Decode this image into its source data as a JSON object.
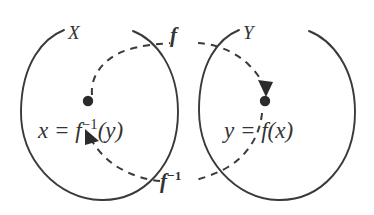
{
  "figure": {
    "type": "mathematical-diagram",
    "ink_color": "#3a3a3a",
    "background_color": "#ffffff",
    "sets": [
      {
        "id": "X",
        "label": "X",
        "side": "left",
        "element_label_plain": "x = f^-1(y)",
        "element_label_lhs": "x = f",
        "element_label_sup": "−1",
        "element_label_rhs": "(y)"
      },
      {
        "id": "Y",
        "label": "Y",
        "side": "right",
        "element_label_plain": "y = f(x)",
        "element_label_lhs": "y = f(x)",
        "element_label_sup": "",
        "element_label_rhs": ""
      }
    ],
    "maps": [
      {
        "id": "forward",
        "label_lhs": "f",
        "label_sup": "",
        "label_plain": "f",
        "direction": "X to Y",
        "position": "top",
        "style": "dashed-arrow"
      },
      {
        "id": "inverse",
        "label_lhs": "f",
        "label_sup": "−1",
        "label_plain": "f^-1",
        "direction": "Y to X",
        "position": "bottom",
        "style": "dashed-arrow"
      }
    ]
  }
}
